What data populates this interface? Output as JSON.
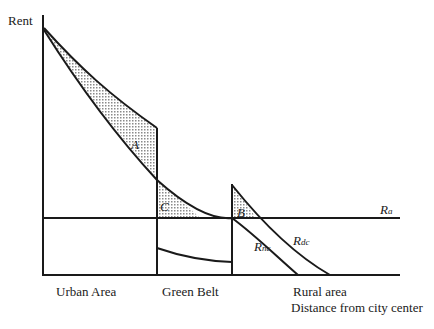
{
  "figure": {
    "y_axis_label": "Rent",
    "x_axis_label": "Distance from city center",
    "zones": [
      {
        "label": "Urban Area"
      },
      {
        "label": "Green Belt"
      },
      {
        "label": "Rural area"
      }
    ],
    "areas": {
      "a": "A",
      "b": "B",
      "c": "C"
    },
    "curves": {
      "ra": {
        "main": "R",
        "sub": "a"
      },
      "rnc": {
        "main": "R",
        "sub": "nc"
      },
      "rdc": {
        "main": "R",
        "sub": "dc"
      }
    },
    "colors": {
      "line": "#1a1a1a",
      "hatch": "#9a9a9a",
      "background": "#ffffff"
    }
  }
}
